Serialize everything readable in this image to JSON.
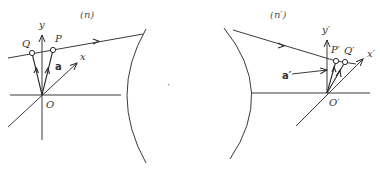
{
  "diagram": {
    "left_panel": {
      "title": "(n)",
      "origin_label": "O",
      "y_axis_label": "y",
      "x_axis_label": "x",
      "point_p_label": "P",
      "point_q_label": "Q",
      "vector_label": "a"
    },
    "right_panel": {
      "title": "(n′)",
      "origin_label": "O′",
      "y_axis_label": "y′",
      "x_axis_label": "x′",
      "point_p_label": "P′",
      "point_q_label": "Q′",
      "vector_label": "a′"
    },
    "center_mark": "·",
    "colors": {
      "line": "#3a3a3a",
      "text": "#333333",
      "background": "#ffffff"
    }
  }
}
